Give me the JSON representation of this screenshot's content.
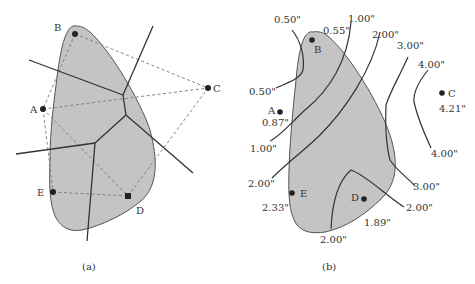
{
  "figure": {
    "panels": [
      {
        "id": "a",
        "caption": "(a)",
        "description": "Watershed region with gauge stations A-E, Thiessen polygon construction (dashed triangulation, solid perpendicular bisectors)",
        "stations": [
          {
            "name": "A"
          },
          {
            "name": "B"
          },
          {
            "name": "C"
          },
          {
            "name": "D"
          },
          {
            "name": "E"
          }
        ]
      },
      {
        "id": "b",
        "caption": "(b)",
        "description": "Isohyetal map of the same watershed with rainfall contours",
        "stations": [
          {
            "name": "A",
            "value": "0.87\""
          },
          {
            "name": "B",
            "value": "0.55\""
          },
          {
            "name": "C",
            "value": "4.21\""
          },
          {
            "name": "D",
            "value": "1.89\""
          },
          {
            "name": "E",
            "value": "2.33\""
          }
        ],
        "contour_labels": {
          "c050_top": "0.50\"",
          "c050_bottom": "0.50\"",
          "c100_top": "1.00\"",
          "c100_bottom": "1.00\"",
          "c200_top": "2.00\"",
          "c200_left": "2.00\"",
          "c200_right": "2.00\"",
          "c200_bottom": "2.00\"",
          "c300_top": "3.00\"",
          "c300_bottom": "3.00\"",
          "c400_top": "4.00\"",
          "c400_bottom": "4.00\""
        }
      }
    ]
  }
}
